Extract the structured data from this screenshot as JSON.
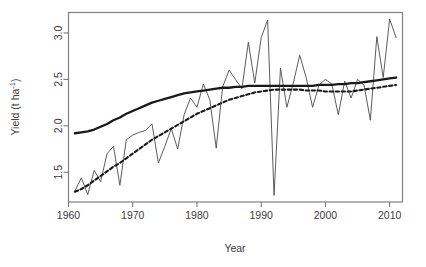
{
  "chart_data": {
    "type": "line",
    "title": "",
    "xlabel": "Year",
    "ylabel": "Yield (t ha-1)",
    "ylabel_display": "Yield (t ha",
    "ylabel_sup": "-1",
    "ylabel_tail": ")",
    "xlim": [
      1960,
      2012
    ],
    "ylim": [
      1.18,
      3.22
    ],
    "grid": false,
    "legend": "none",
    "xticks": [
      1960,
      1970,
      1980,
      1990,
      2000,
      2010
    ],
    "xticklabels": [
      "1960",
      "1970",
      "1980",
      "1990",
      "2000",
      "2010"
    ],
    "yticks": [
      1.5,
      2.0,
      2.5,
      3.0
    ],
    "yticklabels": [
      "1.5",
      "2.0",
      "2.5",
      "3.0"
    ],
    "x": [
      1961,
      1962,
      1963,
      1964,
      1965,
      1966,
      1967,
      1968,
      1969,
      1970,
      1971,
      1972,
      1973,
      1974,
      1975,
      1976,
      1977,
      1978,
      1979,
      1980,
      1981,
      1982,
      1983,
      1984,
      1985,
      1986,
      1987,
      1988,
      1989,
      1990,
      1991,
      1992,
      1993,
      1994,
      1995,
      1996,
      1997,
      1998,
      1999,
      2000,
      2001,
      2002,
      2003,
      2004,
      2005,
      2006,
      2007,
      2008,
      2009,
      2010,
      2011
    ],
    "series": [
      {
        "name": "observed-yield",
        "style": "thin-solid",
        "values": [
          1.3,
          1.44,
          1.26,
          1.52,
          1.4,
          1.7,
          1.78,
          1.36,
          1.85,
          1.9,
          1.93,
          1.95,
          2.02,
          1.6,
          1.78,
          1.97,
          1.75,
          2.12,
          2.3,
          2.2,
          2.45,
          2.28,
          1.76,
          2.42,
          2.6,
          2.5,
          2.4,
          2.9,
          2.46,
          2.95,
          3.14,
          1.25,
          2.62,
          2.2,
          2.46,
          2.76,
          2.52,
          2.2,
          2.44,
          2.5,
          2.45,
          2.12,
          2.48,
          2.3,
          2.5,
          2.44,
          2.06,
          2.96,
          2.52,
          3.15,
          2.95
        ]
      },
      {
        "name": "solid-smooth-trend",
        "style": "thick-solid",
        "values": [
          1.92,
          1.93,
          1.94,
          1.96,
          1.99,
          2.02,
          2.06,
          2.09,
          2.13,
          2.16,
          2.19,
          2.22,
          2.25,
          2.27,
          2.29,
          2.31,
          2.33,
          2.35,
          2.36,
          2.37,
          2.38,
          2.39,
          2.4,
          2.41,
          2.41,
          2.42,
          2.42,
          2.43,
          2.43,
          2.43,
          2.43,
          2.43,
          2.43,
          2.43,
          2.43,
          2.43,
          2.43,
          2.43,
          2.44,
          2.44,
          2.44,
          2.45,
          2.45,
          2.46,
          2.46,
          2.47,
          2.48,
          2.49,
          2.5,
          2.51,
          2.52
        ]
      },
      {
        "name": "dashed-smooth-trend",
        "style": "dashed",
        "values": [
          1.29,
          1.32,
          1.36,
          1.41,
          1.46,
          1.51,
          1.56,
          1.6,
          1.65,
          1.7,
          1.75,
          1.8,
          1.85,
          1.89,
          1.93,
          1.97,
          2.01,
          2.05,
          2.09,
          2.13,
          2.16,
          2.19,
          2.22,
          2.25,
          2.28,
          2.3,
          2.32,
          2.34,
          2.36,
          2.37,
          2.38,
          2.39,
          2.39,
          2.39,
          2.39,
          2.39,
          2.38,
          2.38,
          2.38,
          2.37,
          2.37,
          2.37,
          2.37,
          2.37,
          2.38,
          2.39,
          2.4,
          2.41,
          2.42,
          2.43,
          2.44
        ]
      }
    ]
  },
  "axes": {
    "x_title": "Year",
    "y_title_main": "Yield (t ha",
    "y_title_sup": "-1",
    "y_title_close": ")"
  },
  "colors": {
    "background": "#ffffff",
    "frame": "#808080",
    "observed": "#4a4a4a",
    "trend": "#1a1a1a",
    "text": "#3b3b3b"
  }
}
